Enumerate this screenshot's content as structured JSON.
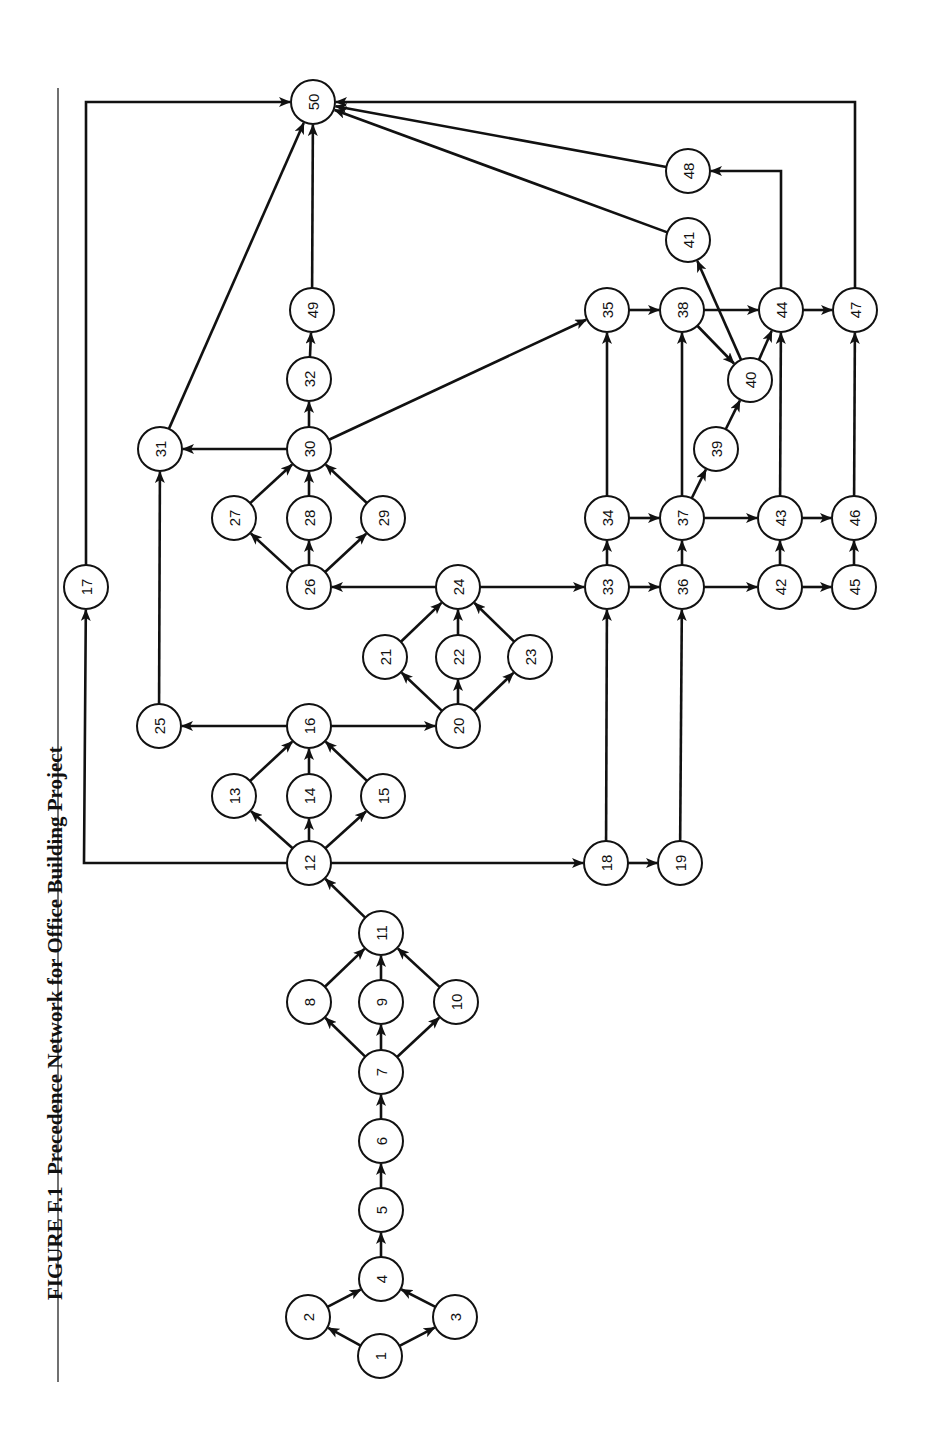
{
  "figure": {
    "label": "FIGURE F.1",
    "title": "Precedence Network for Office Building Project",
    "orientation": "rotated 90° counter-clockwise"
  },
  "colors": {
    "ink": "#111111",
    "background": "#ffffff"
  },
  "node_radius": 22,
  "nodes": [
    {
      "id": "1",
      "x": 380,
      "y": 1356
    },
    {
      "id": "2",
      "x": 308,
      "y": 1317
    },
    {
      "id": "3",
      "x": 455,
      "y": 1317
    },
    {
      "id": "4",
      "x": 381,
      "y": 1279
    },
    {
      "id": "5",
      "x": 381,
      "y": 1210
    },
    {
      "id": "6",
      "x": 381,
      "y": 1141
    },
    {
      "id": "7",
      "x": 381,
      "y": 1072
    },
    {
      "id": "8",
      "x": 309,
      "y": 1002
    },
    {
      "id": "9",
      "x": 381,
      "y": 1002
    },
    {
      "id": "10",
      "x": 456,
      "y": 1002
    },
    {
      "id": "11",
      "x": 381,
      "y": 933
    },
    {
      "id": "12",
      "x": 309,
      "y": 863
    },
    {
      "id": "13",
      "x": 234,
      "y": 796
    },
    {
      "id": "14",
      "x": 309,
      "y": 796
    },
    {
      "id": "15",
      "x": 383,
      "y": 796
    },
    {
      "id": "16",
      "x": 309,
      "y": 726
    },
    {
      "id": "17",
      "x": 86,
      "y": 587
    },
    {
      "id": "18",
      "x": 606,
      "y": 863
    },
    {
      "id": "19",
      "x": 680,
      "y": 863
    },
    {
      "id": "20",
      "x": 458,
      "y": 726
    },
    {
      "id": "21",
      "x": 385,
      "y": 657
    },
    {
      "id": "22",
      "x": 458,
      "y": 657
    },
    {
      "id": "23",
      "x": 530,
      "y": 657
    },
    {
      "id": "24",
      "x": 458,
      "y": 587
    },
    {
      "id": "25",
      "x": 159,
      "y": 726
    },
    {
      "id": "26",
      "x": 309,
      "y": 587
    },
    {
      "id": "27",
      "x": 234,
      "y": 518
    },
    {
      "id": "28",
      "x": 309,
      "y": 518
    },
    {
      "id": "29",
      "x": 383,
      "y": 518
    },
    {
      "id": "30",
      "x": 309,
      "y": 449
    },
    {
      "id": "31",
      "x": 160,
      "y": 449
    },
    {
      "id": "32",
      "x": 309,
      "y": 379
    },
    {
      "id": "33",
      "x": 607,
      "y": 587
    },
    {
      "id": "34",
      "x": 607,
      "y": 518
    },
    {
      "id": "35",
      "x": 607,
      "y": 310
    },
    {
      "id": "36",
      "x": 682,
      "y": 587
    },
    {
      "id": "37",
      "x": 682,
      "y": 518
    },
    {
      "id": "38",
      "x": 682,
      "y": 310
    },
    {
      "id": "39",
      "x": 716,
      "y": 449
    },
    {
      "id": "40",
      "x": 750,
      "y": 380
    },
    {
      "id": "41",
      "x": 688,
      "y": 240
    },
    {
      "id": "42",
      "x": 780,
      "y": 587
    },
    {
      "id": "43",
      "x": 780,
      "y": 518
    },
    {
      "id": "44",
      "x": 781,
      "y": 310
    },
    {
      "id": "45",
      "x": 854,
      "y": 587
    },
    {
      "id": "46",
      "x": 854,
      "y": 518
    },
    {
      "id": "47",
      "x": 855,
      "y": 310
    },
    {
      "id": "48",
      "x": 688,
      "y": 171
    },
    {
      "id": "49",
      "x": 312,
      "y": 310
    },
    {
      "id": "50",
      "x": 313,
      "y": 102
    }
  ],
  "edges": [
    {
      "from": "1",
      "to": "2"
    },
    {
      "from": "1",
      "to": "3"
    },
    {
      "from": "2",
      "to": "4"
    },
    {
      "from": "3",
      "to": "4"
    },
    {
      "from": "4",
      "to": "5"
    },
    {
      "from": "5",
      "to": "6"
    },
    {
      "from": "6",
      "to": "7"
    },
    {
      "from": "7",
      "to": "8"
    },
    {
      "from": "7",
      "to": "9"
    },
    {
      "from": "7",
      "to": "10"
    },
    {
      "from": "8",
      "to": "11"
    },
    {
      "from": "9",
      "to": "11"
    },
    {
      "from": "10",
      "to": "11"
    },
    {
      "from": "11",
      "to": "12"
    },
    {
      "from": "12",
      "to": "13"
    },
    {
      "from": "12",
      "to": "14"
    },
    {
      "from": "12",
      "to": "15"
    },
    {
      "from": "12",
      "to": "17",
      "via": [
        [
          84,
          863
        ]
      ]
    },
    {
      "from": "12",
      "to": "18"
    },
    {
      "from": "13",
      "to": "16"
    },
    {
      "from": "14",
      "to": "16"
    },
    {
      "from": "15",
      "to": "16"
    },
    {
      "from": "16",
      "to": "25"
    },
    {
      "from": "16",
      "to": "20"
    },
    {
      "from": "17",
      "to": "50",
      "via": [
        [
          86,
          102
        ]
      ]
    },
    {
      "from": "18",
      "to": "19"
    },
    {
      "from": "18",
      "to": "33"
    },
    {
      "from": "19",
      "to": "36"
    },
    {
      "from": "20",
      "to": "21"
    },
    {
      "from": "20",
      "to": "22"
    },
    {
      "from": "20",
      "to": "23"
    },
    {
      "from": "21",
      "to": "24"
    },
    {
      "from": "22",
      "to": "24"
    },
    {
      "from": "23",
      "to": "24"
    },
    {
      "from": "24",
      "to": "26"
    },
    {
      "from": "24",
      "to": "33"
    },
    {
      "from": "25",
      "to": "31"
    },
    {
      "from": "26",
      "to": "27"
    },
    {
      "from": "26",
      "to": "28"
    },
    {
      "from": "26",
      "to": "29"
    },
    {
      "from": "27",
      "to": "30"
    },
    {
      "from": "28",
      "to": "30"
    },
    {
      "from": "29",
      "to": "30"
    },
    {
      "from": "30",
      "to": "31"
    },
    {
      "from": "30",
      "to": "32"
    },
    {
      "from": "30",
      "to": "35"
    },
    {
      "from": "31",
      "to": "50"
    },
    {
      "from": "32",
      "to": "49"
    },
    {
      "from": "33",
      "to": "34"
    },
    {
      "from": "33",
      "to": "36"
    },
    {
      "from": "34",
      "to": "35"
    },
    {
      "from": "34",
      "to": "37"
    },
    {
      "from": "35",
      "to": "38"
    },
    {
      "from": "36",
      "to": "37"
    },
    {
      "from": "36",
      "to": "42"
    },
    {
      "from": "37",
      "to": "38"
    },
    {
      "from": "37",
      "to": "39"
    },
    {
      "from": "37",
      "to": "43"
    },
    {
      "from": "38",
      "to": "40"
    },
    {
      "from": "38",
      "to": "44"
    },
    {
      "from": "39",
      "to": "40"
    },
    {
      "from": "40",
      "to": "41"
    },
    {
      "from": "40",
      "to": "44"
    },
    {
      "from": "41",
      "to": "50"
    },
    {
      "from": "42",
      "to": "43"
    },
    {
      "from": "42",
      "to": "45"
    },
    {
      "from": "43",
      "to": "44"
    },
    {
      "from": "43",
      "to": "46"
    },
    {
      "from": "44",
      "to": "47"
    },
    {
      "from": "44",
      "to": "48",
      "via": [
        [
          781,
          171
        ]
      ]
    },
    {
      "from": "45",
      "to": "46"
    },
    {
      "from": "46",
      "to": "47"
    },
    {
      "from": "47",
      "to": "50",
      "via": [
        [
          855,
          102
        ]
      ]
    },
    {
      "from": "48",
      "to": "50"
    },
    {
      "from": "49",
      "to": "50"
    }
  ]
}
